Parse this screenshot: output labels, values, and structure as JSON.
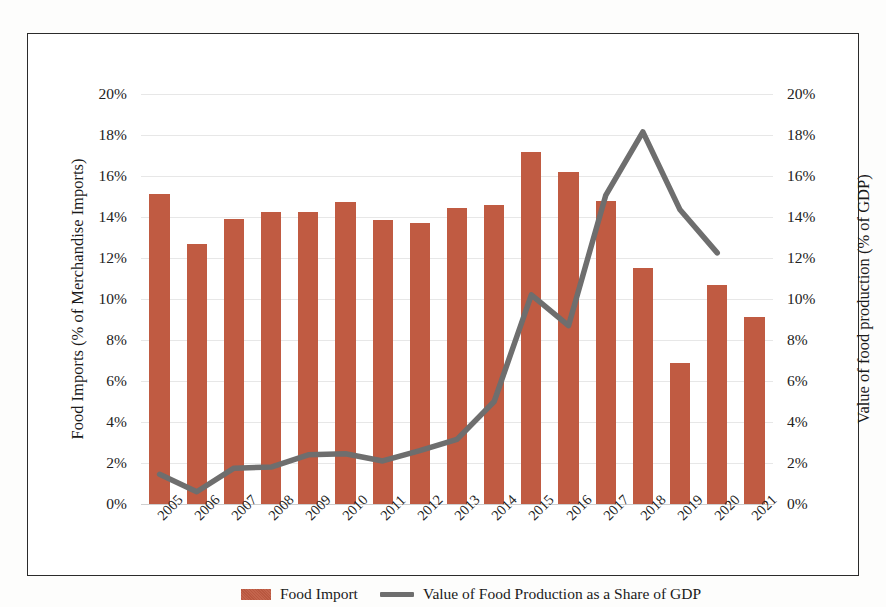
{
  "chart_data": {
    "type": "bar",
    "title": "",
    "subtitle": "",
    "xlabel": "",
    "ylabel": "Food Imports (% of Merchandise Imports)",
    "y2label": "Value of food production (% of GDP)",
    "ylim": [
      0,
      20
    ],
    "y2lim": [
      0,
      20
    ],
    "ytick_labels": [
      "20%",
      "18%",
      "16%",
      "14%",
      "12%",
      "10%",
      "8%",
      "6%",
      "4%",
      "2%",
      "0%"
    ],
    "ytick_values": [
      20,
      18,
      16,
      14,
      12,
      10,
      8,
      6,
      4,
      2,
      0
    ],
    "y2tick_labels": [
      "20%",
      "18%",
      "16%",
      "14%",
      "12%",
      "10%",
      "8%",
      "6%",
      "4%",
      "2%",
      "0%"
    ],
    "grid": true,
    "legend_position": "bottom-center",
    "categories": [
      "2005",
      "2006",
      "2007",
      "2008",
      "2009",
      "2010",
      "2011",
      "2012",
      "2013",
      "2014",
      "2015",
      "2016",
      "2017",
      "2018",
      "2019",
      "2020",
      "2021"
    ],
    "series": [
      {
        "name": "Food Import",
        "type": "bar",
        "axis": "left",
        "color": "#c05b42",
        "values": [
          15.1,
          12.7,
          13.9,
          14.25,
          14.25,
          14.75,
          13.85,
          13.7,
          14.45,
          14.6,
          17.15,
          16.2,
          14.8,
          11.5,
          6.9,
          10.7,
          9.1
        ]
      },
      {
        "name": "Value of Food Production as a Share of GDP",
        "type": "line",
        "axis": "right",
        "color": "#6e6e6e",
        "values": [
          1.45,
          0.6,
          1.75,
          1.8,
          2.4,
          2.45,
          2.1,
          2.6,
          3.15,
          5.0,
          10.2,
          8.7,
          15.05,
          18.15,
          14.35,
          12.25,
          null
        ]
      }
    ]
  },
  "legend": {
    "entries": [
      {
        "label": "Food Import",
        "marker": "bar-swatch-icon",
        "color": "#c05b42"
      },
      {
        "label": "Value of Food Production as a Share of GDP",
        "marker": "line-swatch-icon",
        "color": "#6e6e6e"
      }
    ]
  },
  "axes": {
    "left_title": "Food Imports (% of Merchandise Imports)",
    "right_title": "Value of food production (% of GDP)"
  }
}
